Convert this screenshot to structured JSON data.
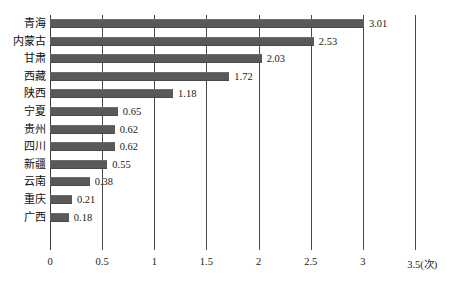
{
  "chart_data": {
    "type": "bar",
    "orientation": "horizontal",
    "title": "",
    "subtitle": "",
    "xlabel": "(次)",
    "ylabel": "",
    "categories": [
      "青海",
      "内蒙古",
      "甘肃",
      "西藏",
      "陕西",
      "宁夏",
      "贵州",
      "四川",
      "新疆",
      "云南",
      "重庆",
      "广西"
    ],
    "values": [
      3.01,
      2.53,
      2.03,
      1.72,
      1.18,
      0.65,
      0.62,
      0.62,
      0.55,
      0.38,
      0.21,
      0.18
    ],
    "value_labels": [
      "3.01",
      "2.53",
      "2.03",
      "1.72",
      "1.18",
      "0.65",
      "0.62",
      "0.62",
      "0.55",
      "0.38",
      "0.21",
      "0.18"
    ],
    "xlim": [
      0,
      3.5
    ],
    "xticks": [
      0,
      0.5,
      1,
      1.5,
      2,
      2.5,
      3,
      3.5
    ],
    "xtick_labels": [
      "0",
      "0.5",
      "1",
      "1.5",
      "2",
      "2.5",
      "3",
      "3.5(次)"
    ],
    "grid": "vertical",
    "legend": "none",
    "bar_color": "#595959",
    "axis_color": "#3a3a3a",
    "background_color": "#ffffff"
  },
  "axis_unit": "(次)"
}
